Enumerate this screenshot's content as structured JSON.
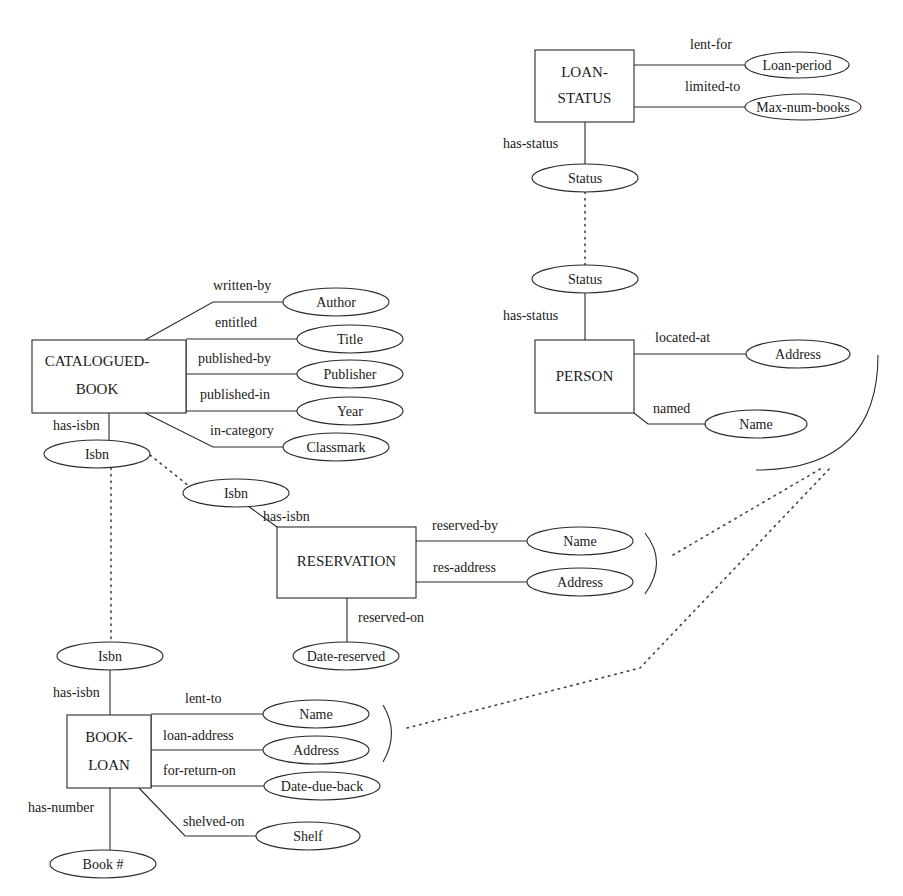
{
  "diagram": {
    "type": "entity-relationship",
    "entities": [
      {
        "id": "loan-status",
        "lines": [
          "LOAN-",
          "STATUS"
        ],
        "x": 535,
        "y": 50,
        "w": 99,
        "h": 72
      },
      {
        "id": "person",
        "lines": [
          "PERSON"
        ],
        "x": 535,
        "y": 340,
        "w": 99,
        "h": 73
      },
      {
        "id": "catalogued-book",
        "lines": [
          "CATALOGUED-",
          "BOOK"
        ],
        "x": 32,
        "y": 340,
        "w": 154,
        "h": 73
      },
      {
        "id": "reservation",
        "lines": [
          "RESERVATION"
        ],
        "x": 277,
        "y": 527,
        "w": 139,
        "h": 71
      },
      {
        "id": "book-loan",
        "lines": [
          "BOOK-",
          "LOAN"
        ],
        "x": 67,
        "y": 715,
        "w": 84,
        "h": 73
      }
    ],
    "attributes": [
      {
        "id": "loan-period",
        "label": "Loan-period",
        "cx": 797,
        "cy": 65,
        "rx": 52,
        "ry": 13
      },
      {
        "id": "max-num-books",
        "label": "Max-num-books",
        "cx": 803,
        "cy": 107,
        "rx": 58,
        "ry": 13
      },
      {
        "id": "status-top",
        "label": "Status",
        "cx": 585,
        "cy": 178,
        "rx": 53,
        "ry": 14
      },
      {
        "id": "status-person",
        "label": "Status",
        "cx": 585,
        "cy": 279,
        "rx": 53,
        "ry": 14
      },
      {
        "id": "person-address",
        "label": "Address",
        "cx": 798,
        "cy": 354,
        "rx": 52,
        "ry": 14
      },
      {
        "id": "person-name",
        "label": "Name",
        "cx": 756,
        "cy": 424,
        "rx": 51,
        "ry": 14
      },
      {
        "id": "author",
        "label": "Author",
        "cx": 336,
        "cy": 302,
        "rx": 53,
        "ry": 14
      },
      {
        "id": "title",
        "label": "Title",
        "cx": 350,
        "cy": 339,
        "rx": 53,
        "ry": 14
      },
      {
        "id": "publisher",
        "label": "Publisher",
        "cx": 350,
        "cy": 374,
        "rx": 53,
        "ry": 14
      },
      {
        "id": "year",
        "label": "Year",
        "cx": 350,
        "cy": 411,
        "rx": 53,
        "ry": 14
      },
      {
        "id": "classmark",
        "label": "Classmark",
        "cx": 336,
        "cy": 447,
        "rx": 53,
        "ry": 14
      },
      {
        "id": "isbn-catalogued",
        "label": "Isbn",
        "cx": 97,
        "cy": 454,
        "rx": 53,
        "ry": 14
      },
      {
        "id": "isbn-reservation",
        "label": "Isbn",
        "cx": 236,
        "cy": 493,
        "rx": 53,
        "ry": 14
      },
      {
        "id": "res-name",
        "label": "Name",
        "cx": 580,
        "cy": 541,
        "rx": 53,
        "ry": 14
      },
      {
        "id": "res-address",
        "label": "Address",
        "cx": 580,
        "cy": 582,
        "rx": 53,
        "ry": 14
      },
      {
        "id": "date-reserved",
        "label": "Date-reserved",
        "cx": 346,
        "cy": 656,
        "rx": 53,
        "ry": 14
      },
      {
        "id": "isbn-bookloan",
        "label": "Isbn",
        "cx": 110,
        "cy": 656,
        "rx": 53,
        "ry": 14
      },
      {
        "id": "bl-name",
        "label": "Name",
        "cx": 316,
        "cy": 714,
        "rx": 53,
        "ry": 14
      },
      {
        "id": "bl-address",
        "label": "Address",
        "cx": 316,
        "cy": 750,
        "rx": 53,
        "ry": 14
      },
      {
        "id": "date-due-back",
        "label": "Date-due-back",
        "cx": 322,
        "cy": 786,
        "rx": 58,
        "ry": 14
      },
      {
        "id": "shelf",
        "label": "Shelf",
        "cx": 308,
        "cy": 836,
        "rx": 52,
        "ry": 14
      },
      {
        "id": "book-number",
        "label": "Book #",
        "cx": 103,
        "cy": 864,
        "rx": 53,
        "ry": 14
      }
    ],
    "relationships": [
      {
        "id": "lent-for",
        "label": "lent-for",
        "lx": 690,
        "ly": 49
      },
      {
        "id": "limited-to",
        "label": "limited-to",
        "lx": 685,
        "ly": 91
      },
      {
        "id": "has-status-1",
        "label": "has-status",
        "lx": 503,
        "ly": 148
      },
      {
        "id": "has-status-2",
        "label": "has-status",
        "lx": 503,
        "ly": 320
      },
      {
        "id": "located-at",
        "label": "located-at",
        "lx": 655,
        "ly": 342
      },
      {
        "id": "named",
        "label": "named",
        "lx": 653,
        "ly": 413
      },
      {
        "id": "written-by",
        "label": "written-by",
        "lx": 213,
        "ly": 290
      },
      {
        "id": "entitled",
        "label": "entitled",
        "lx": 215,
        "ly": 327
      },
      {
        "id": "published-by",
        "label": "published-by",
        "lx": 198,
        "ly": 363
      },
      {
        "id": "published-in",
        "label": "published-in",
        "lx": 200,
        "ly": 399
      },
      {
        "id": "in-category",
        "label": "in-category",
        "lx": 210,
        "ly": 435
      },
      {
        "id": "has-isbn-1",
        "label": "has-isbn",
        "lx": 53,
        "ly": 430
      },
      {
        "id": "has-isbn-2",
        "label": "has-isbn",
        "lx": 263,
        "ly": 521
      },
      {
        "id": "reserved-by",
        "label": "reserved-by",
        "lx": 432,
        "ly": 530
      },
      {
        "id": "res-address-rel",
        "label": "res-address",
        "lx": 433,
        "ly": 572
      },
      {
        "id": "reserved-on",
        "label": "reserved-on",
        "lx": 358,
        "ly": 622
      },
      {
        "id": "has-isbn-3",
        "label": "has-isbn",
        "lx": 53,
        "ly": 697
      },
      {
        "id": "lent-to",
        "label": "lent-to",
        "lx": 185,
        "ly": 703
      },
      {
        "id": "loan-address",
        "label": "loan-address",
        "lx": 163,
        "ly": 740
      },
      {
        "id": "for-return-on",
        "label": "for-return-on",
        "lx": 163,
        "ly": 775
      },
      {
        "id": "has-number",
        "label": "has-number",
        "lx": 28,
        "ly": 812
      },
      {
        "id": "shelved-on",
        "label": "shelved-on",
        "lx": 183,
        "ly": 826
      }
    ]
  }
}
